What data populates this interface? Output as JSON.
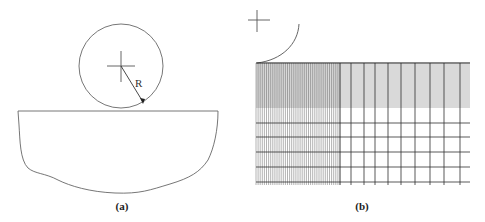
{
  "figure": {
    "panel_a": {
      "caption": "(a)",
      "radius_label": "R",
      "circle": {
        "cx": 121,
        "cy": 66,
        "r": 42
      },
      "workpiece": {
        "top_y": 111,
        "left_x": 18,
        "right_x": 218,
        "bottom_y": 193
      }
    },
    "panel_b": {
      "caption": "(b)",
      "mesh": {
        "x0": 256,
        "x1": 470,
        "y0": 63,
        "y1": 185,
        "dense_region_right_x": 340,
        "dense_band_bottom_y": 108,
        "coarse_vertical_x": [
          351,
          364,
          375,
          388,
          401,
          415,
          430,
          444,
          460
        ],
        "coarse_horizontal_y": [
          123,
          137,
          152,
          167,
          182
        ]
      }
    },
    "colors": {
      "line": "#555555",
      "mesh_dense": "#444444",
      "mesh_coarse": "#333333"
    }
  }
}
